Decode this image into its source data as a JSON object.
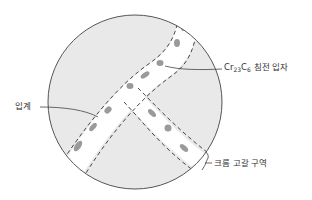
{
  "diagram": {
    "labels": {
      "precipitate": {
        "prefix_1": "Cr",
        "sub_1": "23",
        "prefix_2": "C",
        "sub_2": "6",
        "suffix": " 침전 입자"
      },
      "grain_boundary": "입계",
      "depleted_zone": "크롬 고갈 구역"
    },
    "colors": {
      "grain_fill": "#e9e9e9",
      "boundary_band": "#ffffff",
      "outline": "#555555",
      "dashed": "#333333",
      "particle": "#9a9a9a",
      "leader": "#444444"
    }
  }
}
